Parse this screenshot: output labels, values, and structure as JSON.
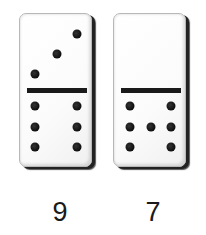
{
  "dominoes": [
    {
      "id": "domino-1",
      "top_pips": 3,
      "bottom_pips": 6,
      "total_label": "9",
      "top_pip_positions": [
        [
          57,
          20
        ],
        [
          37,
          40
        ],
        [
          15,
          60
        ]
      ],
      "bottom_pip_positions": [
        [
          15,
          92
        ],
        [
          57,
          92
        ],
        [
          15,
          113
        ],
        [
          57,
          113
        ],
        [
          15,
          133
        ],
        [
          57,
          133
        ]
      ]
    },
    {
      "id": "domino-2",
      "top_pips": 0,
      "bottom_pips": 7,
      "total_label": "7",
      "top_pip_positions": [],
      "bottom_pip_positions": [
        [
          16,
          92
        ],
        [
          57,
          92
        ],
        [
          16,
          113
        ],
        [
          37,
          113
        ],
        [
          57,
          113
        ],
        [
          16,
          133
        ],
        [
          57,
          133
        ]
      ]
    }
  ],
  "colors": {
    "background": "#ffffff",
    "tile": "#ffffff",
    "pip": "#111111",
    "divider": "#1a1a1a",
    "label": "#1a1a1a"
  }
}
